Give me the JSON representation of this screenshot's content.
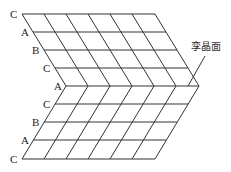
{
  "diagram": {
    "annotation": "孪晶面",
    "colors": {
      "line": "#333333",
      "text": "#222222",
      "background": "#ffffff"
    },
    "top_layers": [
      {
        "label": "C",
        "y": 14,
        "x_start": 22,
        "x_end": 155
      },
      {
        "label": "A",
        "y": 32,
        "x_start": 33,
        "x_end": 166
      },
      {
        "label": "B",
        "y": 50,
        "x_start": 44,
        "x_end": 177
      },
      {
        "label": "C",
        "y": 68,
        "x_start": 55,
        "x_end": 188
      }
    ],
    "twin_layer": {
      "label": "A",
      "y": 86,
      "x_start": 66,
      "x_end": 199
    },
    "bottom_layers": [
      {
        "label": "C",
        "y": 104,
        "x_start": 55,
        "x_end": 188
      },
      {
        "label": "B",
        "y": 122,
        "x_start": 44,
        "x_end": 177
      },
      {
        "label": "A",
        "y": 140,
        "x_start": 33,
        "x_end": 166
      },
      {
        "label": "C",
        "y": 159,
        "x_start": 22,
        "x_end": 155
      }
    ],
    "columns": 7,
    "column_spacing": 22,
    "stacking_sequence_top_to_bottom": [
      "C",
      "A",
      "B",
      "C",
      "A",
      "C",
      "B",
      "A",
      "C"
    ]
  }
}
